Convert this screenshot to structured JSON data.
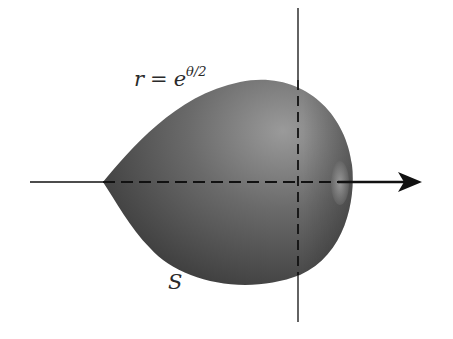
{
  "figure": {
    "curve_equation": {
      "lhs": "r",
      "equals": "=",
      "base": "e",
      "exponent": "θ/2"
    },
    "surface_label": "S",
    "colors": {
      "background": "#ffffff",
      "surface_dark": "#3f3f3f",
      "surface_light": "#8a8a8a",
      "axis": "#111111"
    },
    "axes": {
      "horizontal": {
        "y": 182,
        "x_start": 30,
        "x_end": 420,
        "arrow": true
      },
      "vertical": {
        "x": 298,
        "y_start": 8,
        "y_end": 322,
        "arrow": false
      }
    }
  }
}
